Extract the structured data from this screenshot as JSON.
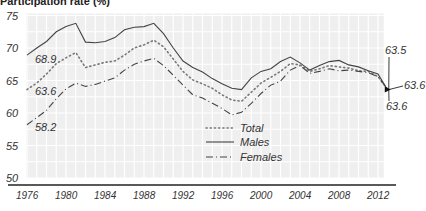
{
  "chart_data": {
    "type": "line",
    "title": "Participation rate (%)",
    "xlabel": "",
    "ylabel": "Participation rate (%)",
    "ylim": [
      50,
      75
    ],
    "xlim": [
      1976,
      2013
    ],
    "yticks": [
      "50",
      "55",
      "60",
      "65",
      "70",
      "75"
    ],
    "xticks": [
      "1976",
      "1980",
      "1984",
      "1988",
      "1992",
      "1996",
      "2000",
      "2004",
      "2008",
      "2012"
    ],
    "grid": true,
    "legend_position": "inside-bottom-center",
    "x": [
      1976,
      1977,
      1978,
      1979,
      1980,
      1981,
      1982,
      1983,
      1984,
      1985,
      1986,
      1987,
      1988,
      1989,
      1990,
      1991,
      1992,
      1993,
      1994,
      1995,
      1996,
      1997,
      1998,
      1999,
      2000,
      2001,
      2002,
      2003,
      2004,
      2005,
      2006,
      2007,
      2008,
      2009,
      2010,
      2011,
      2012,
      2013
    ],
    "series": [
      {
        "name": "Total",
        "style": "dotted",
        "values": [
          63.6,
          64.6,
          66.0,
          67.6,
          68.5,
          69.3,
          67.0,
          67.4,
          67.8,
          68.0,
          68.9,
          70.0,
          70.5,
          71.2,
          70.2,
          68.3,
          66.4,
          65.1,
          64.5,
          63.8,
          62.8,
          62.0,
          61.8,
          63.2,
          64.6,
          65.5,
          66.4,
          67.6,
          67.4,
          66.4,
          66.8,
          67.3,
          67.1,
          66.9,
          66.5,
          66.4,
          65.6,
          63.6
        ]
      },
      {
        "name": "Males",
        "style": "solid",
        "values": [
          68.9,
          70.0,
          71.0,
          72.5,
          73.3,
          73.8,
          70.9,
          70.8,
          71.0,
          71.6,
          72.8,
          73.2,
          73.3,
          73.8,
          72.2,
          70.0,
          68.0,
          67.0,
          66.3,
          65.3,
          64.5,
          63.8,
          63.6,
          65.4,
          66.4,
          66.8,
          67.9,
          68.6,
          67.7,
          66.6,
          67.3,
          67.9,
          68.1,
          67.4,
          67.1,
          66.5,
          66.0,
          63.5
        ]
      },
      {
        "name": "Females",
        "style": "dashed",
        "values": [
          58.2,
          59.3,
          60.4,
          62.2,
          63.7,
          64.6,
          64.1,
          64.4,
          64.9,
          65.4,
          66.6,
          67.5,
          68.0,
          68.4,
          67.3,
          65.8,
          64.3,
          62.8,
          62.3,
          61.5,
          60.7,
          59.7,
          60.1,
          61.5,
          63.0,
          64.3,
          64.9,
          66.6,
          67.3,
          66.1,
          66.4,
          66.8,
          66.5,
          66.6,
          66.4,
          66.2,
          65.6,
          63.6
        ]
      }
    ],
    "annotations": [
      {
        "text": "68.9",
        "series": "Males",
        "x": 1976
      },
      {
        "text": "63.6",
        "series": "Total",
        "x": 1976
      },
      {
        "text": "58.2",
        "series": "Females",
        "x": 1976
      },
      {
        "text": "63.5",
        "series": "Males",
        "x": 2013
      },
      {
        "text": "63.6",
        "series": "Total",
        "x": 2013
      },
      {
        "text": "63.6",
        "series": "Females",
        "x": 2013
      }
    ]
  }
}
